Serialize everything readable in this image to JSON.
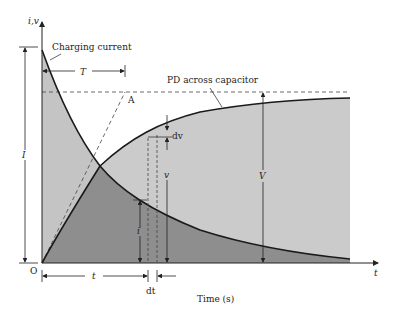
{
  "diagram": {
    "type": "capacitor-charging-curves",
    "axes": {
      "y_label": "i,v",
      "x_label": "t",
      "origin_label": "O",
      "x_title": "Time (s)"
    },
    "curves": {
      "current": {
        "label": "Charging current",
        "color": "#1a1a1a"
      },
      "voltage": {
        "label": "PD across capacitor",
        "color": "#1a1a1a"
      }
    },
    "annotations": {
      "time_constant": "T",
      "tangent_point": "A",
      "initial_current": "I",
      "final_voltage": "V",
      "instant_current": "i",
      "instant_voltage": "v",
      "voltage_increment": "dv",
      "time_increment": "dt",
      "elapsed_time": "t"
    },
    "colors": {
      "light_fill": "#c9c9c9",
      "dark_fill": "#8e8e8e",
      "line": "#1a1a1a",
      "dashed": "#444444"
    }
  }
}
